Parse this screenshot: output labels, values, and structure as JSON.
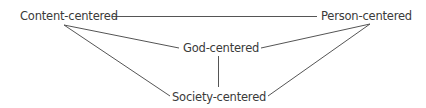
{
  "diagram": {
    "nodes": {
      "content": {
        "label": "Content-centered"
      },
      "person": {
        "label": "Person-centered"
      },
      "god": {
        "label": "God-centered"
      },
      "society": {
        "label": "Society-centered"
      }
    },
    "edges": [
      {
        "from": "Content-centered",
        "to": "Person-centered"
      },
      {
        "from": "Content-centered",
        "to": "God-centered"
      },
      {
        "from": "Content-centered",
        "to": "Society-centered"
      },
      {
        "from": "Person-centered",
        "to": "God-centered"
      },
      {
        "from": "Person-centered",
        "to": "Society-centered"
      },
      {
        "from": "God-centered",
        "to": "Society-centered"
      }
    ],
    "colors": {
      "line": "#555555",
      "text": "#3a3a3a"
    }
  }
}
